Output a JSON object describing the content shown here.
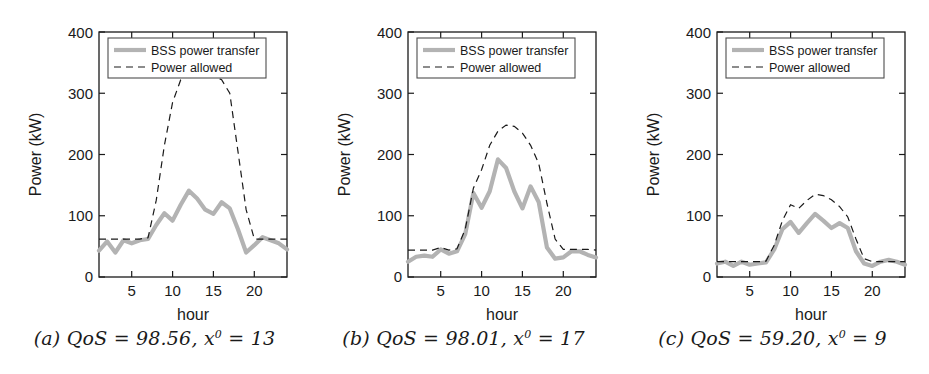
{
  "figure": {
    "panel_count": 3,
    "background": "#ffffff",
    "line_color_bss": "#b3b3b3",
    "line_color_allowed": "#1a1a1a",
    "axis_color": "#1a1a1a"
  },
  "legend": {
    "series_bss_label": "BSS power transfer",
    "series_allowed_label": "Power allowed",
    "position": "upper-left-inside"
  },
  "axes": {
    "ylabel": "Power (kW)",
    "xlabel": "hour",
    "yticks": [
      "0",
      "100",
      "200",
      "300",
      "400"
    ],
    "xticks": [
      "5",
      "10",
      "15",
      "20"
    ],
    "ylim": [
      0,
      400
    ],
    "xlim": [
      1,
      24
    ]
  },
  "captions": {
    "a": {
      "tag": "(a)",
      "metric": "QoS",
      "qos": "98.56",
      "var": "x",
      "sup": "0",
      "x0": "13",
      "full": "(a) QoS = 98.56, x⁰ = 13"
    },
    "b": {
      "tag": "(b)",
      "metric": "QoS",
      "qos": "98.01",
      "var": "x",
      "sup": "0",
      "x0": "17",
      "full": "(b) QoS = 98.01, x⁰ = 17"
    },
    "c": {
      "tag": "(c)",
      "metric": "QoS",
      "qos": "59.20",
      "var": "x",
      "sup": "0",
      "x0": "9",
      "full": "(c) QoS = 59.20, x⁰ = 9"
    }
  },
  "chart_data": [
    {
      "type": "line",
      "panel": "a",
      "title": "(a) QoS = 98.56, x0 = 13",
      "xlabel": "hour",
      "ylabel": "Power (kW)",
      "xlim": [
        1,
        24
      ],
      "ylim": [
        0,
        400
      ],
      "grid": false,
      "legend": [
        "BSS power transfer",
        "Power allowed"
      ],
      "x": [
        1,
        2,
        3,
        4,
        5,
        6,
        7,
        8,
        9,
        10,
        11,
        12,
        13,
        14,
        15,
        16,
        17,
        18,
        19,
        20,
        21,
        22,
        23,
        24
      ],
      "series": [
        {
          "name": "BSS power transfer",
          "values": [
            43,
            58,
            40,
            60,
            55,
            60,
            62,
            85,
            104,
            92,
            118,
            141,
            128,
            110,
            103,
            122,
            112,
            78,
            40,
            52,
            65,
            60,
            55,
            45
          ]
        },
        {
          "name": "Power allowed",
          "values": [
            62,
            62,
            62,
            62,
            62,
            62,
            64,
            125,
            215,
            285,
            322,
            330,
            332,
            330,
            328,
            322,
            300,
            205,
            110,
            62,
            62,
            62,
            62,
            62
          ]
        }
      ]
    },
    {
      "type": "line",
      "panel": "b",
      "title": "(b) QoS = 98.01, x0 = 17",
      "xlabel": "hour",
      "ylabel": "Power (kW)",
      "xlim": [
        1,
        24
      ],
      "ylim": [
        0,
        400
      ],
      "grid": false,
      "legend": [
        "BSS power transfer",
        "Power allowed"
      ],
      "x": [
        1,
        2,
        3,
        4,
        5,
        6,
        7,
        8,
        9,
        10,
        11,
        12,
        13,
        14,
        15,
        16,
        17,
        18,
        19,
        20,
        21,
        22,
        23,
        24
      ],
      "series": [
        {
          "name": "BSS power transfer",
          "values": [
            25,
            33,
            35,
            33,
            45,
            38,
            42,
            70,
            137,
            113,
            140,
            192,
            178,
            140,
            112,
            148,
            122,
            48,
            30,
            32,
            42,
            42,
            36,
            32
          ]
        },
        {
          "name": "Power allowed",
          "values": [
            44,
            44,
            44,
            44,
            48,
            44,
            46,
            78,
            145,
            175,
            215,
            238,
            248,
            246,
            235,
            215,
            185,
            120,
            62,
            45,
            45,
            45,
            45,
            44
          ]
        }
      ]
    },
    {
      "type": "line",
      "panel": "c",
      "title": "(c) QoS = 59.20, x0 = 9",
      "xlabel": "hour",
      "ylabel": "Power (kW)",
      "xlim": [
        1,
        24
      ],
      "ylim": [
        0,
        400
      ],
      "grid": false,
      "legend": [
        "BSS power transfer",
        "Power allowed"
      ],
      "x": [
        1,
        2,
        3,
        4,
        5,
        6,
        7,
        8,
        9,
        10,
        11,
        12,
        13,
        14,
        15,
        16,
        17,
        18,
        19,
        20,
        21,
        22,
        23,
        24
      ],
      "series": [
        {
          "name": "BSS power transfer",
          "values": [
            22,
            25,
            18,
            25,
            20,
            22,
            24,
            45,
            78,
            90,
            72,
            88,
            103,
            92,
            80,
            88,
            80,
            42,
            22,
            18,
            25,
            28,
            25,
            20
          ]
        },
        {
          "name": "Power allowed",
          "values": [
            25,
            25,
            25,
            25,
            25,
            25,
            26,
            52,
            92,
            118,
            112,
            125,
            135,
            133,
            126,
            115,
            98,
            62,
            30,
            25,
            25,
            25,
            25,
            25
          ]
        }
      ]
    }
  ]
}
